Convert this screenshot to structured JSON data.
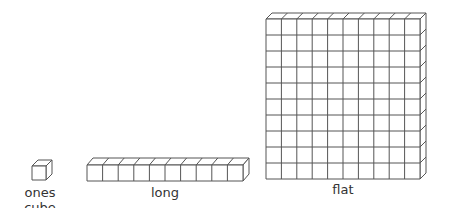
{
  "diagram": {
    "blocks": [
      {
        "name": "ones cube",
        "label": "ones cube",
        "cols": 1,
        "rows": 1
      },
      {
        "name": "long",
        "label": "long",
        "cols": 10,
        "rows": 1
      },
      {
        "name": "flat",
        "label": "flat",
        "cols": 10,
        "rows": 10
      }
    ],
    "stroke_color": "#555555"
  }
}
